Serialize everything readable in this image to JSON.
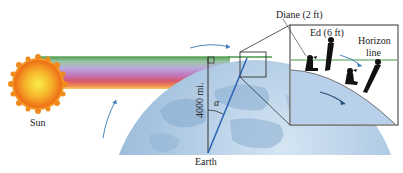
{
  "figure": {
    "labels": {
      "sun": "Sun",
      "earth": "Earth",
      "radius": "4000 mi.",
      "angle": "α",
      "diane": "Diane (2 ft)",
      "ed": "Ed (6 ft)",
      "horizon_line_1": "Horizon",
      "horizon_line_2": "line"
    },
    "colors": {
      "sun_core": "#f7e03a",
      "sun_outer": "#f08a1c",
      "earth": "#a9c6e2",
      "earth_dark": "#7fa8cf",
      "horizon_line": "#4a9a4a",
      "radius_line": "#2a62b4",
      "arrow": "#3a7ab8",
      "inset_ground": "#b8d0ea",
      "silhouette": "#111111",
      "box_stroke": "#333333"
    },
    "rainbow_bands": [
      "#5aa55a",
      "#8fbf8f",
      "#b4a9d6",
      "#b87cc4",
      "#d65b77",
      "#ef8e54",
      "#f6c25a"
    ]
  }
}
